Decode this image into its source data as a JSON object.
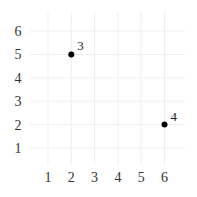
{
  "chart_data": {
    "type": "scatter",
    "title": "",
    "xlabel": "",
    "ylabel": "",
    "xlim": [
      0.5,
      6.5
    ],
    "ylim": [
      0,
      6.5
    ],
    "x_ticks": [
      1,
      2,
      3,
      4,
      5,
      6
    ],
    "y_ticks": [
      1,
      2,
      3,
      4,
      5,
      6
    ],
    "grid": true,
    "legend": null,
    "points": [
      {
        "x": 2,
        "y": 5,
        "label": "3"
      },
      {
        "x": 6,
        "y": 2,
        "label": "4"
      }
    ],
    "colors": {
      "point": "#000000",
      "grid": "#efefef",
      "text": "#333333"
    }
  }
}
